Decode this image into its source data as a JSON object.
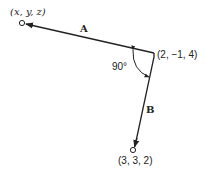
{
  "diagram": {
    "vectors": [
      {
        "name": "A",
        "label": "A",
        "from": "(2, −1, 4)",
        "to": "(x, y, z)"
      },
      {
        "name": "B",
        "label": "B",
        "from": "(2, −1, 4)",
        "to": "(3, 3, 2)"
      }
    ],
    "points": {
      "unknown": "(x, y, z)",
      "vertex": "(2, −1, 4)",
      "endpoint_b": "(3, 3, 2)"
    },
    "angle_label": "90°",
    "colors": {
      "line": "#222222",
      "background": "#ffffff"
    }
  }
}
